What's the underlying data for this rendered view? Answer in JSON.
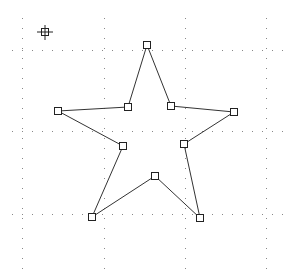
{
  "canvas": {
    "name": "star-polygon-editor",
    "grid": {
      "style": "dotted",
      "color": "#888888"
    },
    "shape": {
      "type": "polygon",
      "name": "five-point-star",
      "stroke": "#333333",
      "fill": "none",
      "vertex_handle_count": 10
    },
    "cursor": {
      "icon": "crosshair-move-icon"
    }
  }
}
